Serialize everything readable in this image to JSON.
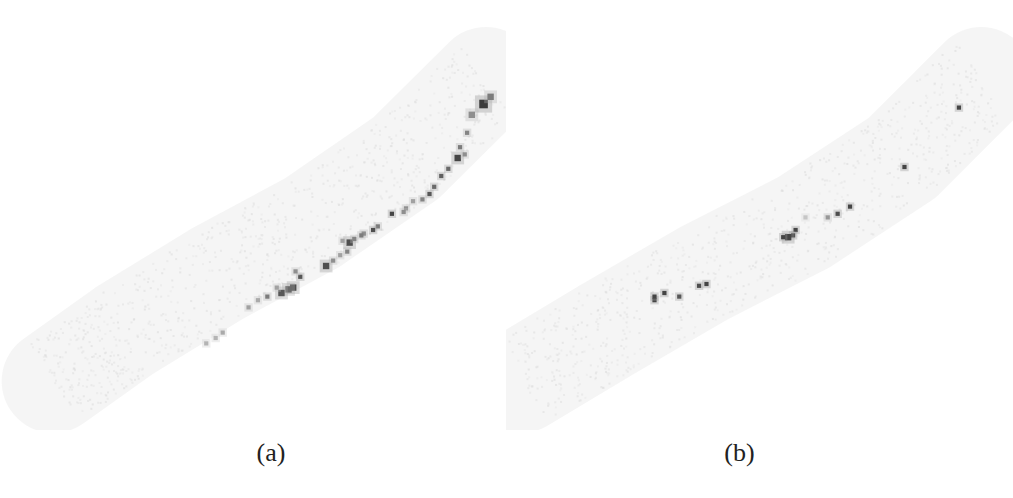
{
  "figure": {
    "panels": [
      {
        "id": "a",
        "caption": "(a)"
      },
      {
        "id": "b",
        "caption": "(b)"
      }
    ]
  },
  "colors": {
    "background": "#ffffff",
    "band": "#e9e9e9",
    "point_dark": "#3a3a3a",
    "point_mid": "#7a7a7a",
    "point_light": "#bdbdbd",
    "caption": "#222222"
  },
  "chart_data": [
    {
      "type": "scatter",
      "title": "",
      "caption": "(a)",
      "xlabel": "",
      "ylabel": "",
      "xlim": [
        0,
        100
      ],
      "ylim": [
        0,
        100
      ],
      "grid": false,
      "legend": "none",
      "background_band": {
        "description": "faint curved diagonal band of low-density points",
        "centerline": [
          [
            5,
            8
          ],
          [
            20,
            22
          ],
          [
            40,
            38
          ],
          [
            60,
            52
          ],
          [
            80,
            70
          ],
          [
            97,
            92
          ]
        ],
        "halfwidth": 9
      },
      "series": [
        {
          "name": "dense points",
          "points": [
            {
              "x": 96.5,
              "y": 85,
              "intensity": 0.95,
              "size": 3
            },
            {
              "x": 98,
              "y": 87,
              "intensity": 0.6,
              "size": 2
            },
            {
              "x": 94,
              "y": 82,
              "intensity": 0.5,
              "size": 2
            },
            {
              "x": 93,
              "y": 77,
              "intensity": 0.55,
              "size": 1
            },
            {
              "x": 91.5,
              "y": 73,
              "intensity": 0.6,
              "size": 1
            },
            {
              "x": 91,
              "y": 70,
              "intensity": 0.9,
              "size": 2
            },
            {
              "x": 92.5,
              "y": 71,
              "intensity": 0.5,
              "size": 1
            },
            {
              "x": 89,
              "y": 67,
              "intensity": 0.7,
              "size": 1
            },
            {
              "x": 87.5,
              "y": 65,
              "intensity": 0.75,
              "size": 1
            },
            {
              "x": 86,
              "y": 62,
              "intensity": 0.7,
              "size": 1
            },
            {
              "x": 85,
              "y": 60,
              "intensity": 0.8,
              "size": 1
            },
            {
              "x": 83.5,
              "y": 58.5,
              "intensity": 0.55,
              "size": 1
            },
            {
              "x": 81.5,
              "y": 58,
              "intensity": 0.4,
              "size": 1
            },
            {
              "x": 80,
              "y": 56,
              "intensity": 0.5,
              "size": 1
            },
            {
              "x": 77,
              "y": 54.5,
              "intensity": 0.9,
              "size": 1
            },
            {
              "x": 79.5,
              "y": 55,
              "intensity": 0.5,
              "size": 1
            },
            {
              "x": 74,
              "y": 51,
              "intensity": 0.6,
              "size": 1
            },
            {
              "x": 73,
              "y": 50,
              "intensity": 0.85,
              "size": 1
            },
            {
              "x": 71,
              "y": 49,
              "intensity": 0.6,
              "size": 1
            },
            {
              "x": 70.5,
              "y": 48.5,
              "intensity": 0.6,
              "size": 1
            },
            {
              "x": 68,
              "y": 46.5,
              "intensity": 0.85,
              "size": 2
            },
            {
              "x": 69,
              "y": 47.5,
              "intensity": 0.55,
              "size": 1
            },
            {
              "x": 66.5,
              "y": 47,
              "intensity": 0.4,
              "size": 1
            },
            {
              "x": 67.5,
              "y": 44,
              "intensity": 0.55,
              "size": 1
            },
            {
              "x": 66,
              "y": 43,
              "intensity": 0.4,
              "size": 1
            },
            {
              "x": 63,
              "y": 40,
              "intensity": 0.85,
              "size": 2
            },
            {
              "x": 64.5,
              "y": 41.5,
              "intensity": 0.5,
              "size": 1
            },
            {
              "x": 57.5,
              "y": 37,
              "intensity": 0.8,
              "size": 1
            },
            {
              "x": 56.5,
              "y": 38.5,
              "intensity": 0.5,
              "size": 1
            },
            {
              "x": 56,
              "y": 34,
              "intensity": 0.85,
              "size": 2
            },
            {
              "x": 55,
              "y": 33.5,
              "intensity": 0.7,
              "size": 2
            },
            {
              "x": 53.5,
              "y": 32.5,
              "intensity": 0.8,
              "size": 2
            },
            {
              "x": 52.5,
              "y": 34,
              "intensity": 0.4,
              "size": 1
            },
            {
              "x": 50.5,
              "y": 31.5,
              "intensity": 0.6,
              "size": 1
            },
            {
              "x": 48.5,
              "y": 30.5,
              "intensity": 0.35,
              "size": 1
            },
            {
              "x": 46.5,
              "y": 28.5,
              "intensity": 0.4,
              "size": 1
            },
            {
              "x": 41,
              "y": 21.5,
              "intensity": 0.35,
              "size": 1
            },
            {
              "x": 39.5,
              "y": 20,
              "intensity": 0.3,
              "size": 1
            },
            {
              "x": 37.5,
              "y": 18.5,
              "intensity": 0.3,
              "size": 1
            }
          ]
        }
      ]
    },
    {
      "type": "scatter",
      "title": "",
      "caption": "(b)",
      "xlabel": "",
      "ylabel": "",
      "xlim": [
        0,
        100
      ],
      "ylim": [
        0,
        100
      ],
      "grid": false,
      "legend": "none",
      "background_band": {
        "description": "faint curved diagonal band of low-density points",
        "centerline": [
          [
            3,
            8
          ],
          [
            20,
            22
          ],
          [
            40,
            38
          ],
          [
            60,
            52
          ],
          [
            80,
            70
          ],
          [
            96,
            92
          ]
        ],
        "halfwidth": 9
      },
      "series": [
        {
          "name": "selected points",
          "points": [
            {
              "x": 91.5,
              "y": 84,
              "intensity": 0.9,
              "size": 1
            },
            {
              "x": 80.5,
              "y": 67.5,
              "intensity": 0.9,
              "size": 1
            },
            {
              "x": 69.5,
              "y": 56.5,
              "intensity": 0.9,
              "size": 1
            },
            {
              "x": 67,
              "y": 54.5,
              "intensity": 0.85,
              "size": 1
            },
            {
              "x": 65,
              "y": 53.5,
              "intensity": 0.45,
              "size": 1
            },
            {
              "x": 60.5,
              "y": 53.5,
              "intensity": 0.2,
              "size": 1
            },
            {
              "x": 58.5,
              "y": 50,
              "intensity": 0.9,
              "size": 1
            },
            {
              "x": 58,
              "y": 48.5,
              "intensity": 0.9,
              "size": 1
            },
            {
              "x": 57,
              "y": 48,
              "intensity": 0.9,
              "size": 2
            },
            {
              "x": 56,
              "y": 48,
              "intensity": 0.9,
              "size": 1
            },
            {
              "x": 40.5,
              "y": 35,
              "intensity": 0.9,
              "size": 1
            },
            {
              "x": 39,
              "y": 34.5,
              "intensity": 0.85,
              "size": 1
            },
            {
              "x": 35,
              "y": 31.5,
              "intensity": 0.8,
              "size": 1
            },
            {
              "x": 32,
              "y": 32.5,
              "intensity": 0.9,
              "size": 1
            },
            {
              "x": 30,
              "y": 30.5,
              "intensity": 0.9,
              "size": 1
            },
            {
              "x": 30,
              "y": 31.5,
              "intensity": 0.9,
              "size": 1
            }
          ]
        }
      ]
    }
  ]
}
